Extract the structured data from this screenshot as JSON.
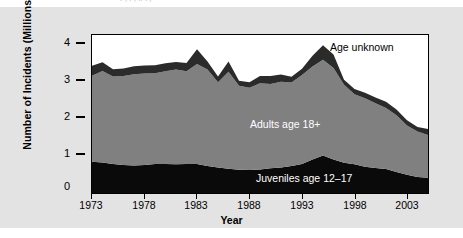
{
  "figure": {
    "panel_color": "#e3e3e3",
    "plot_background": "#ffffff",
    "clipped_header_fragment": "r  ,  .  ,  ..  . ,"
  },
  "chart_data": {
    "type": "area",
    "stacked": true,
    "title": "",
    "subtitle": "",
    "xlabel": "Year",
    "ylabel": "Number of Incidents (Millions)",
    "xlim": [
      1973,
      2005
    ],
    "ylim": [
      0,
      4.35
    ],
    "xticks": [
      1973,
      1978,
      1983,
      1988,
      1993,
      1998,
      2003
    ],
    "xtick_labels": [
      "1973",
      "1978",
      "1983",
      "1988",
      "1993",
      "1998",
      "2003"
    ],
    "yticks": [
      0,
      1,
      2,
      3,
      4
    ],
    "ytick_labels": [
      "0",
      "1",
      "2",
      "3",
      "4"
    ],
    "grid": false,
    "legend_position": "inline-annotations",
    "x": [
      1973,
      1974,
      1975,
      1976,
      1977,
      1978,
      1979,
      1980,
      1981,
      1982,
      1983,
      1984,
      1985,
      1986,
      1987,
      1988,
      1989,
      1990,
      1991,
      1992,
      1993,
      1994,
      1995,
      1996,
      1997,
      1998,
      1999,
      2000,
      2001,
      2002,
      2003,
      2004,
      2005
    ],
    "series": [
      {
        "name": "Juveniles age 12-17",
        "label": "Juveniles age 12–17",
        "color": "#0a0a0a",
        "values": [
          0.86,
          0.84,
          0.8,
          0.77,
          0.76,
          0.77,
          0.8,
          0.8,
          0.79,
          0.8,
          0.8,
          0.74,
          0.7,
          0.67,
          0.64,
          0.63,
          0.65,
          0.68,
          0.7,
          0.74,
          0.8,
          0.92,
          1.03,
          0.92,
          0.83,
          0.79,
          0.72,
          0.69,
          0.66,
          0.58,
          0.5,
          0.44,
          0.42
        ]
      },
      {
        "name": "Adults age 18+",
        "label": "Adults age 18+",
        "color": "#808080",
        "values": [
          2.37,
          2.52,
          2.41,
          2.45,
          2.51,
          2.52,
          2.5,
          2.55,
          2.61,
          2.55,
          2.75,
          2.66,
          2.35,
          2.67,
          2.31,
          2.27,
          2.37,
          2.32,
          2.36,
          2.3,
          2.45,
          2.56,
          2.64,
          2.52,
          2.15,
          1.93,
          1.89,
          1.78,
          1.68,
          1.56,
          1.36,
          1.25,
          1.18
        ]
      },
      {
        "name": "Age unknown",
        "label": "Age unknown",
        "color": "#2b2b2b",
        "values": [
          0.27,
          0.24,
          0.2,
          0.21,
          0.22,
          0.22,
          0.22,
          0.22,
          0.21,
          0.23,
          0.41,
          0.22,
          0.16,
          0.28,
          0.14,
          0.15,
          0.2,
          0.22,
          0.2,
          0.16,
          0.17,
          0.3,
          0.4,
          0.37,
          0.14,
          0.14,
          0.15,
          0.16,
          0.17,
          0.16,
          0.14,
          0.13,
          0.16
        ]
      }
    ],
    "totals": [
      3.5,
      3.6,
      3.41,
      3.43,
      3.49,
      3.51,
      3.52,
      3.57,
      3.61,
      3.58,
      3.96,
      3.62,
      3.21,
      3.62,
      3.09,
      3.05,
      3.22,
      3.22,
      3.26,
      3.2,
      3.42,
      3.78,
      4.07,
      3.81,
      3.12,
      2.86,
      2.76,
      2.63,
      2.51,
      2.3,
      2.0,
      1.82,
      1.76
    ]
  }
}
